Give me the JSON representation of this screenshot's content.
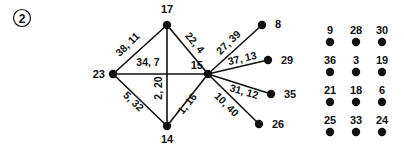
{
  "figure": {
    "panel_label": "2",
    "graph": {
      "nodes": [
        {
          "id": "n17",
          "label": "17",
          "x": 167,
          "y": 25,
          "lx": 167,
          "ly": 13,
          "anchor": "middle"
        },
        {
          "id": "n23",
          "label": "23",
          "x": 113,
          "y": 74,
          "lx": 105,
          "ly": 78,
          "anchor": "end"
        },
        {
          "id": "n15",
          "label": "15",
          "x": 208,
          "y": 74,
          "lx": 203,
          "ly": 69,
          "anchor": "end"
        },
        {
          "id": "n14",
          "label": "14",
          "x": 167,
          "y": 126,
          "lx": 167,
          "ly": 143,
          "anchor": "middle"
        },
        {
          "id": "n8",
          "label": "8",
          "x": 262,
          "y": 25,
          "lx": 275,
          "ly": 28,
          "anchor": "start"
        },
        {
          "id": "n29",
          "label": "29",
          "x": 268,
          "y": 60,
          "lx": 281,
          "ly": 64,
          "anchor": "start"
        },
        {
          "id": "n35",
          "label": "35",
          "x": 271,
          "y": 94,
          "lx": 284,
          "ly": 98,
          "anchor": "start"
        },
        {
          "id": "n26",
          "label": "26",
          "x": 259,
          "y": 124,
          "lx": 272,
          "ly": 128,
          "anchor": "start"
        }
      ],
      "edges": [
        {
          "id": "e-23-17",
          "from": "n23",
          "to": "n17",
          "label": "38, 11",
          "lx": 130,
          "ly": 47,
          "rotate": -44
        },
        {
          "id": "e-17-15",
          "from": "n17",
          "to": "n15",
          "label": "22, 4",
          "lx": 192,
          "ly": 45,
          "rotate": 50
        },
        {
          "id": "e-23-15",
          "from": "n23",
          "to": "n15",
          "label": "34, 7",
          "lx": 148,
          "ly": 66,
          "rotate": 0
        },
        {
          "id": "e-23-14",
          "from": "n23",
          "to": "n14",
          "label": "5, 32",
          "lx": 131,
          "ly": 104,
          "rotate": 44
        },
        {
          "id": "e-17-14",
          "from": "n17",
          "to": "n14",
          "label": "2, 20",
          "lx": 162,
          "ly": 88,
          "rotate": -90
        },
        {
          "id": "e-14-15",
          "from": "n14",
          "to": "n15",
          "label": "1, 16",
          "lx": 190,
          "ly": 106,
          "rotate": -51
        },
        {
          "id": "e-15-8",
          "from": "n15",
          "to": "n8",
          "label": "27, 39",
          "lx": 231,
          "ly": 45,
          "rotate": -44
        },
        {
          "id": "e-15-29",
          "from": "n15",
          "to": "n29",
          "label": "37, 13",
          "lx": 243,
          "ly": 62,
          "rotate": -13
        },
        {
          "id": "e-15-35",
          "from": "n15",
          "to": "n35",
          "label": "31, 12",
          "lx": 243,
          "ly": 95,
          "rotate": 16
        },
        {
          "id": "e-15-26",
          "from": "n15",
          "to": "n26",
          "label": "10, 40",
          "lx": 224,
          "ly": 107,
          "rotate": 45
        }
      ]
    },
    "grid": {
      "origin_x": 330,
      "origin_y": 34,
      "col_step": 26,
      "row_step": 30,
      "rows": [
        [
          "9",
          "28",
          "30"
        ],
        [
          "36",
          "3",
          "19"
        ],
        [
          "21",
          "18",
          "6"
        ],
        [
          "25",
          "33",
          "24"
        ]
      ]
    }
  }
}
